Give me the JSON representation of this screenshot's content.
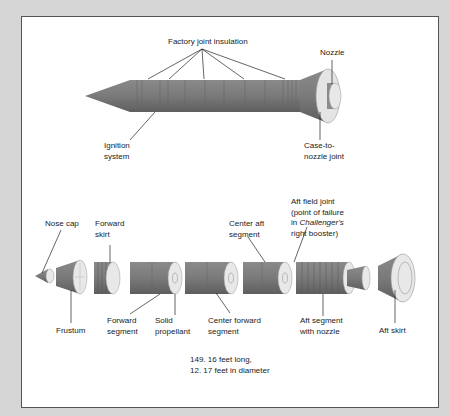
{
  "diagram": {
    "colors": {
      "body": "#7a7a7a",
      "body_dark": "#646464",
      "face": "#e6e6e6",
      "background": "#d6d6d6",
      "panel": "#ffffff"
    },
    "assembled": {
      "labels": {
        "factory_joint_insulation": "Factory joint insulation",
        "nozzle": "Nozzle",
        "ignition_system_1": "Ignition",
        "ignition_system_2": "system",
        "case_to_nozzle_1": "Case-to-",
        "case_to_nozzle_2": "nozzle joint"
      }
    },
    "exploded": {
      "labels": {
        "nose_cap": "Nose cap",
        "forward_skirt_1": "Forward",
        "forward_skirt_2": "skirt",
        "center_aft_1": "Center aft",
        "center_aft_2": "segment",
        "aft_field_joint_1": "Aft field joint",
        "aft_field_joint_2": "(point of failure",
        "aft_field_joint_3a": "in ",
        "aft_field_joint_3b": "Challenger's",
        "aft_field_joint_4": "right booster)",
        "frustum": "Frustum",
        "forward_segment_1": "Forward",
        "forward_segment_2": "segment",
        "solid_propellant_1": "Solid",
        "solid_propellant_2": "propellant",
        "center_forward_1": "Center forward",
        "center_forward_2": "segment",
        "aft_segment_1": "Aft segment",
        "aft_segment_2": "with nozzle",
        "aft_skirt": "Aft skirt"
      }
    },
    "dimensions": {
      "length": "149. 16 feet long,",
      "diameter": "12. 17 feet in diameter"
    }
  }
}
